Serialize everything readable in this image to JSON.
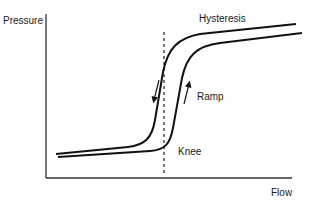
{
  "diagram": {
    "axes": {
      "y_label": "Pressure",
      "x_label": "Flow"
    },
    "annotations": {
      "hysteresis": "Hysteresis",
      "ramp": "Ramp",
      "knee": "Knee"
    },
    "elements": {
      "curves": [
        {
          "name": "hysteresis-curve",
          "direction": "down"
        },
        {
          "name": "ramp-curve",
          "direction": "up"
        }
      ],
      "knee_marker": "dashed-vertical-line"
    },
    "colors": {
      "line": "#111111",
      "text": "#1a1a1a",
      "background": "#ffffff"
    }
  }
}
